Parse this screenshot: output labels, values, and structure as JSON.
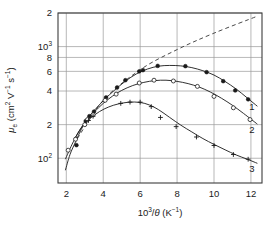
{
  "chart_data": {
    "type": "line",
    "title": "",
    "xlabel": "10^3/θ  (K^-1)",
    "ylabel": "μ_e  (cm^2 V^-1 s^-1)",
    "xlabel_parts": {
      "base": "10",
      "exponent": "3",
      "divider": "/",
      "symbol": "θ",
      "unit_open": "  (K",
      "unit_exp": "-1",
      "unit_close": ")"
    },
    "ylabel_parts": {
      "mu": "μ",
      "sub": "e",
      "open": "  (cm",
      "exp1": "2",
      "v": " V",
      "exp2": "-1",
      "s": " s",
      "exp3": "-1",
      "close": ")"
    },
    "xscale": "linear",
    "yscale": "log",
    "xlim": [
      1.55,
      12.6
    ],
    "ylim": [
      60,
      2000
    ],
    "grid": true,
    "grid_color": "#9a9a9a",
    "axis_color": "#3c3c3c",
    "xticks": [
      2,
      4,
      6,
      8,
      10,
      12
    ],
    "xticklabels": [
      "2",
      "4",
      "6",
      "8",
      "10",
      "12"
    ],
    "yticks": [
      100,
      200,
      400,
      600,
      800,
      1000,
      2000
    ],
    "yticklabels": [
      "10^2",
      "2",
      "4",
      "6",
      "8",
      "10^3",
      "2"
    ],
    "ytick_display": [
      {
        "value": 2000,
        "text": "2",
        "sup": ""
      },
      {
        "value": 1000,
        "text": "10",
        "sup": "3"
      },
      {
        "value": 800,
        "text": "8",
        "sup": ""
      },
      {
        "value": 600,
        "text": "6",
        "sup": ""
      },
      {
        "value": 400,
        "text": "4",
        "sup": ""
      },
      {
        "value": 200,
        "text": "2",
        "sup": ""
      },
      {
        "value": 100,
        "text": "10",
        "sup": "2"
      }
    ],
    "legend_position": "inline-right-end",
    "series": [
      {
        "name": "1",
        "label": "1",
        "marker": "filled-circle",
        "color": "#1a1a1a",
        "points": [
          {
            "x": 2.55,
            "y": 131
          },
          {
            "x": 3.05,
            "y": 215
          },
          {
            "x": 3.25,
            "y": 238
          },
          {
            "x": 3.5,
            "y": 262
          },
          {
            "x": 4.15,
            "y": 350
          },
          {
            "x": 4.75,
            "y": 430
          },
          {
            "x": 5.2,
            "y": 500
          },
          {
            "x": 5.95,
            "y": 600
          },
          {
            "x": 6.15,
            "y": 615
          },
          {
            "x": 6.95,
            "y": 672
          },
          {
            "x": 8.45,
            "y": 668
          },
          {
            "x": 9.6,
            "y": 590
          },
          {
            "x": 10.5,
            "y": 490
          },
          {
            "x": 11.15,
            "y": 405
          },
          {
            "x": 11.85,
            "y": 337
          }
        ],
        "curve": [
          {
            "x": 1.95,
            "y": 78
          },
          {
            "x": 2.2,
            "y": 108
          },
          {
            "x": 2.5,
            "y": 140
          },
          {
            "x": 2.8,
            "y": 180
          },
          {
            "x": 3.2,
            "y": 232
          },
          {
            "x": 3.6,
            "y": 278
          },
          {
            "x": 4.1,
            "y": 340
          },
          {
            "x": 4.6,
            "y": 405
          },
          {
            "x": 5.2,
            "y": 490
          },
          {
            "x": 5.8,
            "y": 570
          },
          {
            "x": 6.4,
            "y": 630
          },
          {
            "x": 7.0,
            "y": 668
          },
          {
            "x": 7.6,
            "y": 678
          },
          {
            "x": 8.2,
            "y": 672
          },
          {
            "x": 8.8,
            "y": 648
          },
          {
            "x": 9.4,
            "y": 608
          },
          {
            "x": 10.0,
            "y": 556
          },
          {
            "x": 10.6,
            "y": 487
          },
          {
            "x": 11.2,
            "y": 417
          },
          {
            "x": 11.8,
            "y": 347
          },
          {
            "x": 12.35,
            "y": 292
          }
        ]
      },
      {
        "name": "2",
        "label": "2",
        "marker": "open-circle",
        "color": "#1a1a1a",
        "points": [
          {
            "x": 2.1,
            "y": 118
          },
          {
            "x": 2.5,
            "y": 148
          },
          {
            "x": 3.0,
            "y": 200
          },
          {
            "x": 3.15,
            "y": 222
          },
          {
            "x": 3.45,
            "y": 245
          },
          {
            "x": 4.1,
            "y": 330
          },
          {
            "x": 4.7,
            "y": 375
          },
          {
            "x": 5.95,
            "y": 472
          },
          {
            "x": 6.75,
            "y": 500
          },
          {
            "x": 7.8,
            "y": 492
          },
          {
            "x": 9.1,
            "y": 440
          },
          {
            "x": 10.0,
            "y": 358
          },
          {
            "x": 11.05,
            "y": 283
          },
          {
            "x": 11.95,
            "y": 222
          }
        ],
        "curve": [
          {
            "x": 1.95,
            "y": 98
          },
          {
            "x": 2.3,
            "y": 132
          },
          {
            "x": 2.7,
            "y": 176
          },
          {
            "x": 3.1,
            "y": 218
          },
          {
            "x": 3.5,
            "y": 258
          },
          {
            "x": 4.0,
            "y": 310
          },
          {
            "x": 4.5,
            "y": 360
          },
          {
            "x": 5.0,
            "y": 405
          },
          {
            "x": 5.6,
            "y": 448
          },
          {
            "x": 6.2,
            "y": 478
          },
          {
            "x": 6.8,
            "y": 496
          },
          {
            "x": 7.4,
            "y": 500
          },
          {
            "x": 8.0,
            "y": 488
          },
          {
            "x": 8.6,
            "y": 466
          },
          {
            "x": 9.2,
            "y": 434
          },
          {
            "x": 9.8,
            "y": 392
          },
          {
            "x": 10.4,
            "y": 345
          },
          {
            "x": 11.0,
            "y": 298
          },
          {
            "x": 11.6,
            "y": 252
          },
          {
            "x": 12.35,
            "y": 202
          }
        ]
      },
      {
        "name": "3",
        "label": "3",
        "marker": "plus",
        "color": "#1a1a1a",
        "points": [
          {
            "x": 3.2,
            "y": 218
          },
          {
            "x": 3.45,
            "y": 238
          },
          {
            "x": 4.95,
            "y": 310
          },
          {
            "x": 5.45,
            "y": 318
          },
          {
            "x": 6.0,
            "y": 318
          },
          {
            "x": 6.6,
            "y": 290
          },
          {
            "x": 7.1,
            "y": 232
          },
          {
            "x": 7.95,
            "y": 192
          },
          {
            "x": 9.05,
            "y": 155
          },
          {
            "x": 10.0,
            "y": 130
          },
          {
            "x": 11.05,
            "y": 108
          },
          {
            "x": 11.85,
            "y": 98
          }
        ],
        "curve": [
          {
            "x": 2.45,
            "y": 150
          },
          {
            "x": 2.9,
            "y": 196
          },
          {
            "x": 3.3,
            "y": 228
          },
          {
            "x": 3.8,
            "y": 262
          },
          {
            "x": 4.3,
            "y": 288
          },
          {
            "x": 4.8,
            "y": 306
          },
          {
            "x": 5.4,
            "y": 318
          },
          {
            "x": 6.0,
            "y": 316
          },
          {
            "x": 6.5,
            "y": 300
          },
          {
            "x": 7.0,
            "y": 272
          },
          {
            "x": 7.6,
            "y": 232
          },
          {
            "x": 8.2,
            "y": 198
          },
          {
            "x": 8.8,
            "y": 172
          },
          {
            "x": 9.4,
            "y": 150
          },
          {
            "x": 10.0,
            "y": 133
          },
          {
            "x": 10.6,
            "y": 119
          },
          {
            "x": 11.2,
            "y": 107
          },
          {
            "x": 11.8,
            "y": 98
          },
          {
            "x": 12.35,
            "y": 90
          }
        ]
      }
    ],
    "reference_line": {
      "name": "dashed-asymptote",
      "style": "dashed",
      "color": "#4a4a4a",
      "points": [
        {
          "x": 2.6,
          "y": 150
        },
        {
          "x": 4.0,
          "y": 330
        },
        {
          "x": 6.0,
          "y": 620
        },
        {
          "x": 8.0,
          "y": 940
        },
        {
          "x": 10.0,
          "y": 1320
        },
        {
          "x": 12.3,
          "y": 1860
        }
      ]
    },
    "annotations": [
      {
        "name": "curve-end-label-1",
        "text": "1",
        "x": 12.05,
        "y": 268
      },
      {
        "name": "curve-end-label-2",
        "text": "2",
        "x": 12.05,
        "y": 170
      },
      {
        "name": "curve-end-label-3",
        "text": "3",
        "x": 12.05,
        "y": 75
      }
    ]
  }
}
